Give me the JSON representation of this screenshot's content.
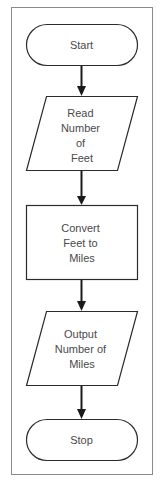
{
  "diagram": {
    "type": "flowchart",
    "direction": "top-to-bottom",
    "colors": {
      "background": "#ffffff",
      "frame": "#8a8a8a",
      "stroke": "#2b2b2b",
      "arrow": "#1a1a1a",
      "text": "#4a4a4a"
    },
    "nodes": [
      {
        "id": "start",
        "shape": "terminator",
        "lines": [
          "Start"
        ]
      },
      {
        "id": "read",
        "shape": "parallelogram",
        "lines": [
          "Read",
          "Number",
          "of",
          "Feet"
        ]
      },
      {
        "id": "convert",
        "shape": "process",
        "lines": [
          "Convert",
          "Feet to",
          "Miles"
        ]
      },
      {
        "id": "output",
        "shape": "parallelogram",
        "lines": [
          "Output",
          "Number of",
          "Miles"
        ]
      },
      {
        "id": "stop",
        "shape": "terminator",
        "lines": [
          "Stop"
        ]
      }
    ],
    "edges": [
      {
        "from": "start",
        "to": "read"
      },
      {
        "from": "read",
        "to": "convert"
      },
      {
        "from": "convert",
        "to": "output"
      },
      {
        "from": "output",
        "to": "stop"
      }
    ]
  }
}
